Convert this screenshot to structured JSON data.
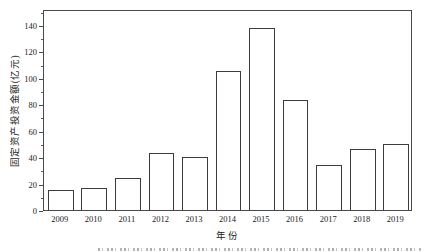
{
  "chart_data": {
    "type": "bar",
    "title": "",
    "categories": [
      "2009",
      "2010",
      "2011",
      "2012",
      "2013",
      "2014",
      "2015",
      "2016",
      "2017",
      "2018",
      "2019"
    ],
    "values": [
      15,
      17,
      24,
      43,
      40,
      105,
      138,
      83,
      34,
      46,
      50
    ],
    "xlabel": "年份",
    "ylabel": "固定资产投资金额(亿元)",
    "ylim": [
      0,
      152
    ],
    "yticks": [
      0,
      20,
      40,
      60,
      80,
      100,
      120,
      140
    ],
    "minor_ytick_step": 10,
    "grid": false,
    "legend": false,
    "bar_fill": "#ffffff",
    "bar_border": "#3c3c3c",
    "frame": "closed-box"
  },
  "colors": {
    "background": "#ffffff",
    "axis": "#4a4a4a",
    "text": "#1c1c1c"
  },
  "footer": {
    "note": "partially-clipped caption strip at bottom edge (text cut off, illegible)"
  }
}
